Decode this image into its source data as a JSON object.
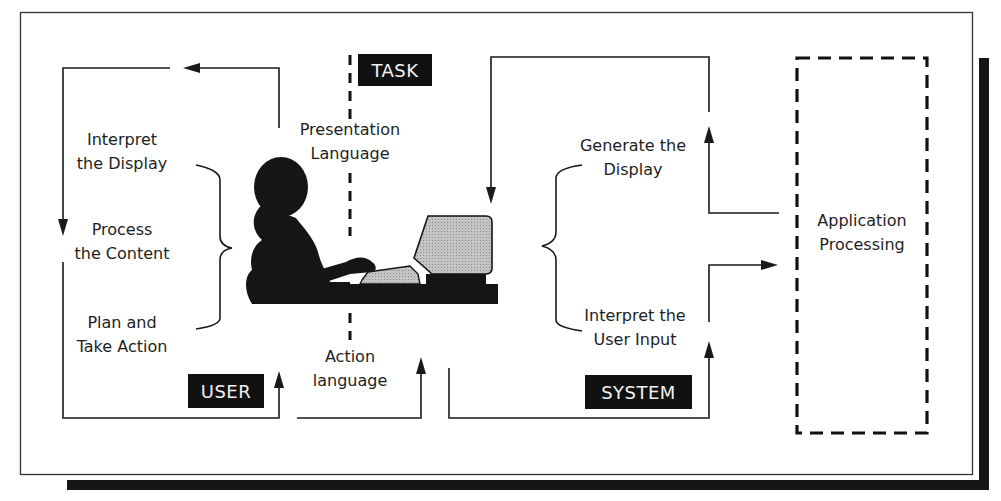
{
  "diagram": {
    "type": "human-computer interaction model",
    "tags": {
      "task": "TASK",
      "user": "USER",
      "system": "SYSTEM"
    },
    "user_steps": [
      {
        "line1": "Interpret",
        "line2": "the Display"
      },
      {
        "line1": "Process",
        "line2": "the Content"
      },
      {
        "line1": "Plan and",
        "line2": "Take Action"
      }
    ],
    "languages": {
      "presentation": {
        "line1": "Presentation",
        "line2": "Language"
      },
      "action": {
        "line1": "Action",
        "line2": "language"
      }
    },
    "system_steps": [
      {
        "line1": "Generate the",
        "line2": "Display"
      },
      {
        "line1": "Interpret the",
        "line2": "User Input"
      }
    ],
    "application": {
      "line1": "Application",
      "line2": "Processing"
    },
    "colors": {
      "ink": "#111111",
      "screen_fill": "#b9b9b9",
      "background": "#ffffff"
    }
  }
}
